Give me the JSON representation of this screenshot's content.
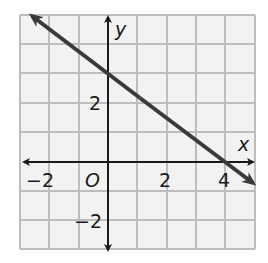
{
  "graph": {
    "type": "coordinate-plane-line",
    "x_range": [
      -3,
      5
    ],
    "y_range": [
      -3,
      5
    ],
    "grid_step": 1,
    "axis_labels": {
      "x": "x",
      "y": "y"
    },
    "origin_label": "O",
    "x_tick_labels": [
      {
        "value": -2,
        "text": "−2"
      },
      {
        "value": 2,
        "text": "2"
      },
      {
        "value": 4,
        "text": "4"
      }
    ],
    "y_tick_labels": [
      {
        "value": 2,
        "text": "2"
      },
      {
        "value": -2,
        "text": "−2"
      }
    ],
    "line": {
      "slope": -0.75,
      "y_intercept": 3,
      "x_intercept": 4,
      "points": [
        [
          0,
          3
        ],
        [
          4,
          0
        ]
      ],
      "color": "#3a3a3a"
    },
    "colors": {
      "grid": "#bdbdbd",
      "background": "#f2f2f2",
      "axis": "#1a1a1a"
    }
  }
}
